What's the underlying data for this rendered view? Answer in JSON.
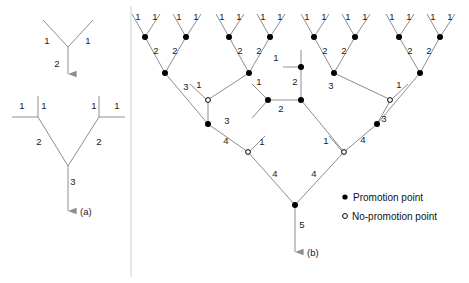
{
  "figure": {
    "panel_a_label": "(a)",
    "panel_b_label": "(b)",
    "legend": {
      "promotion_label": "Promotion point",
      "no_promotion_label": "No-promotion point",
      "promotion_marker": "filled-dot-icon",
      "no_promotion_marker": "open-dot-icon"
    },
    "colors": {
      "edge": "#8d8d8d",
      "text": "#1a1a1a",
      "node_fill": "#000000",
      "node_open_fill": "#ffffff",
      "background": "#ffffff"
    }
  },
  "panel_a": {
    "top_tree": {
      "edge_labels": [
        "1",
        "1",
        "2"
      ],
      "arrow": "down-arrow-icon"
    },
    "bottom_tree": {
      "edge_labels": [
        "1",
        "1",
        "1",
        "1",
        "2",
        "2",
        "3"
      ],
      "arrow": "down-arrow-icon"
    }
  },
  "panel_b": {
    "arrow": "down-arrow-icon",
    "root_label": "5",
    "level1_labels": [
      "1",
      "1",
      "1",
      "1",
      "1",
      "1",
      "1",
      "1",
      "1",
      "1",
      "1",
      "1",
      "1",
      "1",
      "1",
      "1"
    ],
    "level2_labels": [
      "2",
      "2",
      "2",
      "2",
      "2",
      "2",
      "2",
      "2"
    ],
    "level3_labels": [
      "3",
      "3",
      "3",
      "3"
    ],
    "level4_labels": [
      "4",
      "4",
      "4",
      "4"
    ],
    "mid_subtree_labels": [
      "1",
      "1",
      "2",
      "2"
    ],
    "spur_labels": [
      "1",
      "1",
      "1",
      "1"
    ]
  },
  "edge_labels": {
    "a_top": [
      {
        "t": "1",
        "x": 47,
        "y": 44
      },
      {
        "t": "1",
        "x": 88,
        "y": 44
      },
      {
        "t": "2",
        "x": 57,
        "y": 67
      }
    ],
    "a_bottom": [
      {
        "t": "1",
        "x": 22,
        "y": 109
      },
      {
        "t": "1",
        "x": 44,
        "y": 109
      },
      {
        "t": "1",
        "x": 94,
        "y": 109
      },
      {
        "t": "1",
        "x": 117,
        "y": 109
      },
      {
        "t": "2",
        "x": 39,
        "y": 145
      },
      {
        "t": "2",
        "x": 99,
        "y": 145
      },
      {
        "t": "3",
        "x": 73,
        "y": 185
      }
    ],
    "b_level1": [
      {
        "t": "1",
        "x": 138,
        "y": 20
      },
      {
        "t": "1",
        "x": 155,
        "y": 20
      },
      {
        "t": "1",
        "x": 179,
        "y": 20
      },
      {
        "t": "1",
        "x": 196,
        "y": 20
      },
      {
        "t": "1",
        "x": 222,
        "y": 20
      },
      {
        "t": "1",
        "x": 239,
        "y": 20
      },
      {
        "t": "1",
        "x": 263,
        "y": 20
      },
      {
        "t": "1",
        "x": 280,
        "y": 20
      },
      {
        "t": "1",
        "x": 307,
        "y": 20
      },
      {
        "t": "1",
        "x": 324,
        "y": 20
      },
      {
        "t": "1",
        "x": 348,
        "y": 20
      },
      {
        "t": "1",
        "x": 365,
        "y": 20
      },
      {
        "t": "1",
        "x": 392,
        "y": 20
      },
      {
        "t": "1",
        "x": 409,
        "y": 20
      },
      {
        "t": "1",
        "x": 433,
        "y": 20
      },
      {
        "t": "1",
        "x": 450,
        "y": 20
      }
    ],
    "b_level2": [
      {
        "t": "2",
        "x": 156,
        "y": 54
      },
      {
        "t": "2",
        "x": 175,
        "y": 54
      },
      {
        "t": "2",
        "x": 240,
        "y": 54
      },
      {
        "t": "2",
        "x": 259,
        "y": 54
      },
      {
        "t": "2",
        "x": 325,
        "y": 54
      },
      {
        "t": "2",
        "x": 344,
        "y": 54
      },
      {
        "t": "2",
        "x": 410,
        "y": 54
      },
      {
        "t": "2",
        "x": 429,
        "y": 54
      }
    ],
    "b_level3": [
      {
        "t": "3",
        "x": 186,
        "y": 90
      },
      {
        "t": "3",
        "x": 227,
        "y": 124
      },
      {
        "t": "3",
        "x": 331,
        "y": 89
      },
      {
        "t": "3",
        "x": 384,
        "y": 122
      }
    ],
    "b_level4": [
      {
        "t": "4",
        "x": 226,
        "y": 144
      },
      {
        "t": "4",
        "x": 275,
        "y": 177
      },
      {
        "t": "4",
        "x": 314,
        "y": 177
      },
      {
        "t": "4",
        "x": 363,
        "y": 143
      }
    ],
    "b_spurs": [
      {
        "t": "1",
        "x": 199,
        "y": 88
      },
      {
        "t": "1",
        "x": 262,
        "y": 145
      },
      {
        "t": "1",
        "x": 326,
        "y": 144
      },
      {
        "t": "1",
        "x": 399,
        "y": 88
      }
    ],
    "b_mid": [
      {
        "t": "1",
        "x": 276,
        "y": 61
      },
      {
        "t": "1",
        "x": 259,
        "y": 85
      },
      {
        "t": "2",
        "x": 295,
        "y": 85
      },
      {
        "t": "2",
        "x": 281,
        "y": 112
      }
    ],
    "b_root": [
      {
        "t": "5",
        "x": 302,
        "y": 228
      }
    ]
  },
  "nodes": {
    "filled": [
      {
        "x": 145,
        "y": 37
      },
      {
        "x": 186,
        "y": 37
      },
      {
        "x": 229,
        "y": 37
      },
      {
        "x": 270,
        "y": 37
      },
      {
        "x": 314,
        "y": 37
      },
      {
        "x": 355,
        "y": 37
      },
      {
        "x": 399,
        "y": 37
      },
      {
        "x": 440,
        "y": 37
      },
      {
        "x": 165,
        "y": 73
      },
      {
        "x": 249,
        "y": 73
      },
      {
        "x": 334,
        "y": 73
      },
      {
        "x": 420,
        "y": 73
      },
      {
        "x": 208,
        "y": 124
      },
      {
        "x": 377,
        "y": 124
      },
      {
        "x": 295,
        "y": 205
      },
      {
        "x": 301,
        "y": 67
      },
      {
        "x": 268,
        "y": 100
      },
      {
        "x": 301,
        "y": 100
      }
    ],
    "open": [
      {
        "x": 208,
        "y": 100
      },
      {
        "x": 390,
        "y": 100
      },
      {
        "x": 248,
        "y": 152
      },
      {
        "x": 344,
        "y": 152
      }
    ]
  }
}
